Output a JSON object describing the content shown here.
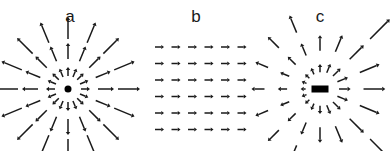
{
  "figure": {
    "background_color": "#ffffff",
    "ink_color": "#1a1a1a",
    "width": 390,
    "height": 151
  },
  "panels": [
    {
      "id": "a",
      "label": "a",
      "label_x": 70,
      "label_y": 18,
      "center_x": 68,
      "center_y": 89,
      "field_type": "radial-source",
      "description": "Isotropic outward radial vector field from a point source",
      "core_shape": "dot",
      "core_width": 7,
      "core_height": 7,
      "n_rays": 16,
      "n_rings": 3,
      "ring_radii": [
        13,
        30,
        50
      ],
      "ring_arrow_lengths": [
        9,
        16,
        22
      ],
      "symmetric": true,
      "arrow_head_size": 3.6,
      "stroke_width": 1.5
    },
    {
      "id": "b",
      "label": "b",
      "label_x": 196,
      "label_y": 18,
      "center_x": 196,
      "center_y": 89,
      "field_type": "uniform",
      "description": "Uniform constant vector field, all arrows point right with equal magnitude",
      "grid_cols": 6,
      "grid_rows": 6,
      "grid_x0": 155,
      "grid_y0": 47,
      "grid_dx": 16.5,
      "grid_dy": 16.5,
      "arrow_length": 9,
      "arrow_angle_deg": 0,
      "arrow_head_size": 3.2,
      "stroke_width": 1.5
    },
    {
      "id": "c",
      "label": "c",
      "label_x": 320,
      "label_y": 18,
      "center_x": 320,
      "center_y": 89,
      "field_type": "anisotropic-source",
      "description": "Asymmetric outward field from an extended bar source, magnitudes larger toward the right and lower-right",
      "core_shape": "bar",
      "core_width": 17,
      "core_height": 7,
      "n_rays": 16,
      "n_rings": 3,
      "ring_radii": [
        14,
        32,
        54
      ],
      "ring_arrow_lengths": [
        8,
        15,
        21
      ],
      "symmetric": false,
      "right_gain": 1.45,
      "left_gain": 0.62,
      "arrow_head_size": 3.6,
      "stroke_width": 1.5
    }
  ],
  "chart_data": {
    "type": "scatter",
    "title": "",
    "xlabel": "",
    "ylabel": "",
    "subplot_labels": [
      "a",
      "b",
      "c"
    ],
    "series": [
      {
        "name": "a",
        "field": "radial outward from point source",
        "rays_deg": [
          0,
          22.5,
          45,
          67.5,
          90,
          112.5,
          135,
          157.5,
          180,
          202.5,
          225,
          247.5,
          270,
          292.5,
          315,
          337.5
        ],
        "ring_radii": [
          13,
          30,
          50
        ],
        "magnitudes": [
          9,
          16,
          22
        ]
      },
      {
        "name": "b",
        "field": "uniform rightward",
        "grid": [
          6,
          6
        ],
        "direction_deg": 0,
        "magnitude": 9
      },
      {
        "name": "c",
        "field": "anisotropic outward from bar source",
        "rays_deg": [
          0,
          22.5,
          45,
          67.5,
          90,
          112.5,
          135,
          157.5,
          180,
          202.5,
          225,
          247.5,
          270,
          292.5,
          315,
          337.5
        ],
        "ring_radii": [
          14,
          32,
          54
        ],
        "magnitudes": [
          8,
          15,
          21
        ],
        "right_gain": 1.45,
        "left_gain": 0.62
      }
    ]
  }
}
